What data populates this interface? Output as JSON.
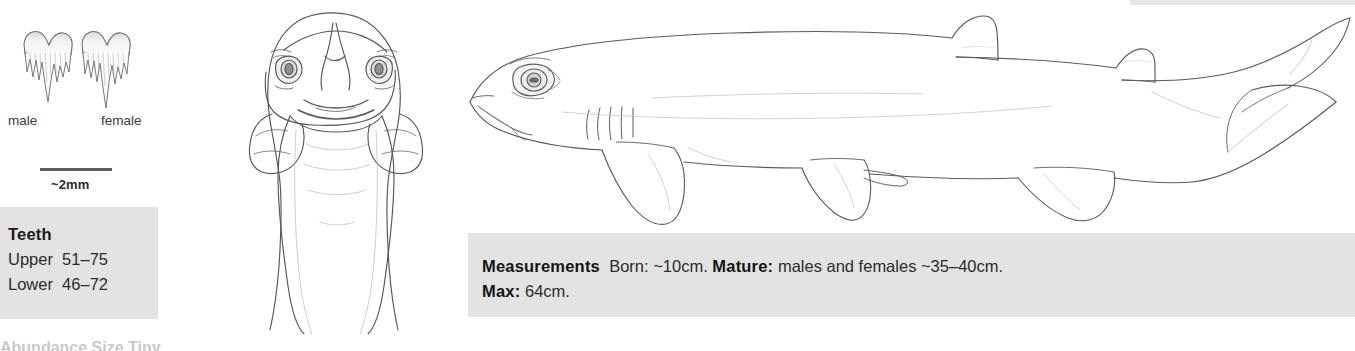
{
  "figure": {
    "background_color": "#ffffff",
    "panel_color": "#e3e3e3",
    "ink_color": "#4a4a4a"
  },
  "teeth_panel": {
    "male_label": "male",
    "female_label": "female",
    "scale_label": "~2mm",
    "tooth_icon_male": "tooth-male-icon",
    "tooth_icon_female": "tooth-female-icon",
    "scale_bar_icon": "scale-bar-icon"
  },
  "teeth_box": {
    "title": "Teeth",
    "rows": [
      {
        "label": "Upper",
        "value": "51–75",
        "text": "Upper  51–75"
      },
      {
        "label": "Lower",
        "value": "46–72",
        "text": "Lower  46–72"
      }
    ]
  },
  "measurements_box": {
    "title": "Measurements",
    "born_label": "Born:",
    "born_value": "~10cm.",
    "mature_label": "Mature:",
    "mature_value": "males and females ~35–40cm.",
    "max_label": "Max:",
    "max_value": "64cm.",
    "line1_lead": "Measurements",
    "line1_rest": "Born: ~10cm.",
    "line1_bold2": "Mature:",
    "line1_tail": "males and females ~35–40cm.",
    "line2_bold": "Max:",
    "line2_rest": "64cm."
  },
  "illustrations": {
    "front_view_name": "shark-head-front-view-illustration",
    "side_view_name": "shark-lateral-view-illustration"
  },
  "cutoff": {
    "text": "Abundance    Size  Tiny"
  }
}
